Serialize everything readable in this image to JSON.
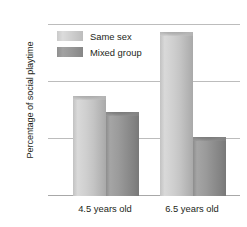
{
  "chart_data": {
    "type": "bar",
    "title": "",
    "xlabel": "",
    "ylabel": "Percentage of social playtime",
    "categories": [
      "4.5 years old",
      "6.5 years old"
    ],
    "series": [
      {
        "name": "Same sex",
        "color": "#cfcfcf",
        "values": [
          44,
          72
        ]
      },
      {
        "name": "Mixed group",
        "color": "#949494",
        "values": [
          37,
          26
        ]
      }
    ],
    "ylim": [
      0,
      75
    ],
    "yticks": [
      "0",
      "25",
      "50",
      "75"
    ],
    "ytick_values": [
      0,
      25,
      50,
      75
    ],
    "grid": true,
    "legend_position": "upper-left-inside"
  },
  "axis": {
    "y_title": "Percentage of social playtime",
    "ticks": [
      {
        "label": "75",
        "value": 75
      },
      {
        "label": "50",
        "value": 50
      },
      {
        "label": "25",
        "value": 25
      },
      {
        "label": "0",
        "value": 0
      }
    ]
  },
  "legend": {
    "items": [
      {
        "label": "Same sex",
        "swatch": "light-gray-swatch"
      },
      {
        "label": "Mixed group",
        "swatch": "dark-gray-swatch"
      }
    ]
  },
  "groups": [
    {
      "label": "4.5 years old",
      "bars": [
        {
          "series": "Same sex",
          "value": 44
        },
        {
          "series": "Mixed group",
          "value": 37
        }
      ]
    },
    {
      "label": "6.5 years old",
      "bars": [
        {
          "series": "Same sex",
          "value": 72
        },
        {
          "series": "Mixed group",
          "value": 26
        }
      ]
    }
  ]
}
